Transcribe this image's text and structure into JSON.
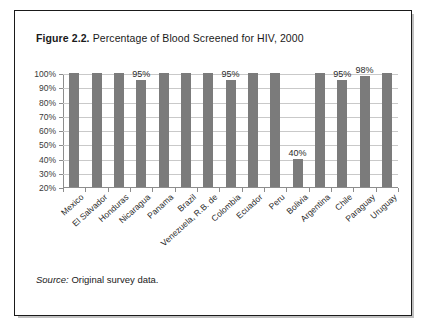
{
  "figure": {
    "number_label": "Figure 2.2.",
    "title_text": " Percentage of Blood Screened for HIV, 2000",
    "source_prefix": "Source:",
    "source_body": " Original survey data."
  },
  "colors": {
    "bar_fill": "#7b7b7b",
    "gridline": "#c9c9c9",
    "axis": "#8d8d8d",
    "frame_border": "#1a1a1a",
    "text": "#1a1a1a"
  },
  "chart_data": {
    "type": "bar",
    "title": "Figure 2.2. Percentage of Blood Screened for HIV, 2000",
    "xlabel": "",
    "ylabel": "",
    "ylim": [
      20,
      100
    ],
    "y_tick_step": 10,
    "y_tick_labels": [
      "100%",
      "90%",
      "80%",
      "70%",
      "60%",
      "50%",
      "40%",
      "30%",
      "20%"
    ],
    "y_tick_values": [
      100,
      90,
      80,
      70,
      60,
      50,
      40,
      30,
      20
    ],
    "grid": true,
    "legend": "none",
    "categories": [
      "Mexico",
      "El Salvador",
      "Honduras",
      "Nicaragua",
      "Panama",
      "Brazil",
      "Venezuela, R.B. de",
      "Colombia",
      "Ecuador",
      "Peru",
      "Bolivia",
      "Argentina",
      "Chile",
      "Paraguay",
      "Uruguay"
    ],
    "values": [
      100,
      100,
      100,
      95,
      100,
      100,
      100,
      95,
      100,
      100,
      40,
      100,
      95,
      98,
      100
    ],
    "point_labels": [
      "",
      "",
      "",
      "95%",
      "",
      "",
      "",
      "95%",
      "",
      "",
      "40%",
      "",
      "95%",
      "98%",
      ""
    ],
    "source": "Source: Original survey data."
  }
}
